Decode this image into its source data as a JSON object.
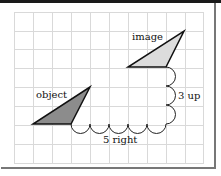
{
  "diagram": {
    "type": "translation-on-grid",
    "grid": {
      "columns": 10,
      "rows": 8
    },
    "labels": {
      "image": "image",
      "object": "object",
      "vertical_move": "3 up",
      "horizontal_move": "5 right"
    },
    "colors": {
      "grid_line": "#d9d9d9",
      "image_fill": "#dcdcdc",
      "object_fill": "#8c8c8c",
      "outline": "#111111"
    }
  }
}
